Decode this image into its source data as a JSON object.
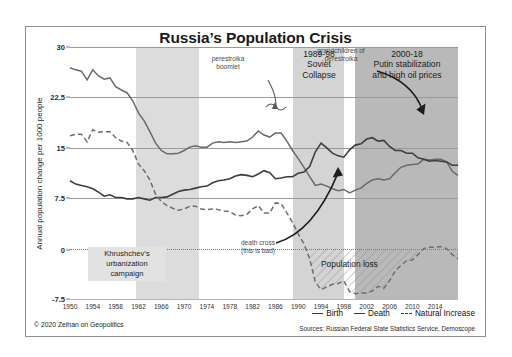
{
  "title": "Russia’s Population Crisis",
  "copyright": "© 2020 Zeihan on Geopolitics",
  "sources": "Sources: Russian Federal State Statistics Service, Demoscope",
  "legend": {
    "birth": "Birth",
    "death": "Death",
    "natural_increase": "Natural Increase"
  },
  "banners": [
    {
      "id": "soviet-collapse",
      "text": "1989-98\nSoviet\nCollapse",
      "lines": [
        "1989-98",
        "Soviet",
        "Collapse"
      ],
      "color": "#d4d4d4"
    },
    {
      "id": "putin",
      "text": "2000-18\nPutin stabilization\nand high oil prices",
      "lines": [
        "2000-18",
        "Putin stabilization",
        "and high oil prices"
      ],
      "color": "#b9b9b9"
    }
  ],
  "annotations": {
    "perestroika_boomlet": "perestroika\nboomlet",
    "perestroika_boomlet_lines": [
      "perestroika",
      "boomlet"
    ],
    "grandchildren": "grandchildren of\nperestroika",
    "grandchildren_lines": [
      "grandchildren of",
      "perestroika"
    ],
    "death_cross": "death cross\n(this is bad)",
    "death_cross_lines": [
      "death cross",
      "(this is bad)"
    ],
    "khrushchev": "Khrushchev’s\nurbanization\ncampaign",
    "khrushchev_lines": [
      "Khrushchev’s",
      "urbanization",
      "campaign"
    ],
    "population_loss": "Population loss"
  },
  "chart_data": {
    "type": "line",
    "title": "Russia’s Population Crisis",
    "xlabel": "",
    "ylabel": "Annual population change per 1000 people",
    "xlim": [
      1950,
      2018
    ],
    "ylim": [
      -7.5,
      30
    ],
    "yticks": [
      30,
      22.5,
      15,
      7.5,
      0,
      -7.5
    ],
    "ytick_labels": [
      "30",
      "22.5",
      "15",
      "7.5",
      "0",
      "-7.5"
    ],
    "xticks": [
      1950,
      1954,
      1958,
      1962,
      1966,
      1970,
      1974,
      1978,
      1982,
      1986,
      1990,
      1994,
      1998,
      2002,
      2006,
      2010,
      2014
    ],
    "grid": "horizontal",
    "legend_position": "bottom-right",
    "shaded_periods": [
      {
        "label": "Khrushchev’s urbanization campaign",
        "start": 1953,
        "end": 1964,
        "color": "#dcdcdc"
      },
      {
        "label": "1989-98 Soviet Collapse",
        "start": 1989,
        "end": 1998,
        "color": "#d4d4d4"
      },
      {
        "label": "2000-18 Putin stabilization and high oil prices",
        "start": 2000,
        "end": 2018,
        "color": "#b9b9b9"
      }
    ],
    "hatched_region": {
      "label": "Population loss",
      "start": 1992,
      "end": 2018,
      "note": "area between Natural Increase curve and zero line"
    },
    "x": [
      1950,
      1951,
      1952,
      1953,
      1954,
      1955,
      1956,
      1957,
      1958,
      1959,
      1960,
      1961,
      1962,
      1963,
      1964,
      1965,
      1966,
      1967,
      1968,
      1969,
      1970,
      1971,
      1972,
      1973,
      1974,
      1975,
      1976,
      1977,
      1978,
      1979,
      1980,
      1981,
      1982,
      1983,
      1984,
      1985,
      1986,
      1987,
      1988,
      1989,
      1990,
      1991,
      1992,
      1993,
      1994,
      1995,
      1996,
      1997,
      1998,
      1999,
      2000,
      2001,
      2002,
      2003,
      2004,
      2005,
      2006,
      2007,
      2008,
      2009,
      2010,
      2011,
      2012,
      2013,
      2014,
      2015,
      2016,
      2017,
      2018
    ],
    "series": [
      {
        "name": "Birth",
        "style": "solid",
        "color": "#575757",
        "values": [
          26.9,
          26.6,
          26.4,
          25.1,
          26.6,
          25.7,
          25.2,
          25.4,
          24.1,
          23.6,
          23.2,
          22.0,
          20.2,
          19.0,
          17.4,
          15.7,
          14.6,
          14.1,
          14.1,
          14.2,
          14.6,
          15.1,
          15.3,
          15.1,
          15.1,
          15.7,
          15.9,
          15.8,
          15.9,
          15.8,
          15.9,
          16.0,
          16.6,
          17.5,
          16.9,
          16.6,
          17.2,
          17.2,
          16.0,
          14.6,
          13.4,
          12.1,
          10.7,
          9.4,
          9.6,
          9.3,
          8.9,
          8.6,
          8.8,
          8.3,
          8.7,
          9.0,
          9.7,
          10.2,
          10.4,
          10.2,
          10.4,
          11.3,
          12.1,
          12.4,
          12.5,
          12.6,
          13.3,
          13.2,
          13.3,
          13.3,
          12.9,
          11.5,
          10.9
        ]
      },
      {
        "name": "Death",
        "style": "solid",
        "color": "#3f3f3f",
        "values": [
          10.1,
          9.6,
          9.4,
          9.2,
          8.9,
          8.4,
          7.8,
          8.0,
          7.6,
          7.6,
          7.4,
          7.4,
          7.6,
          7.4,
          7.2,
          7.6,
          7.6,
          7.7,
          8.1,
          8.5,
          8.7,
          8.8,
          9.0,
          9.2,
          9.3,
          9.8,
          10.1,
          10.2,
          10.4,
          10.8,
          11.0,
          10.9,
          10.7,
          11.1,
          11.6,
          11.3,
          10.4,
          10.5,
          10.7,
          10.7,
          11.2,
          11.4,
          12.2,
          14.4,
          15.7,
          15.0,
          14.2,
          13.8,
          13.6,
          14.7,
          15.4,
          15.6,
          16.3,
          16.5,
          16.0,
          16.1,
          15.2,
          14.6,
          14.6,
          14.2,
          14.2,
          13.5,
          13.3,
          13.0,
          13.1,
          13.0,
          12.9,
          12.4,
          12.4
        ]
      },
      {
        "name": "Natural Increase",
        "style": "dashed",
        "color": "#6b6b6b",
        "values": [
          16.8,
          17.0,
          17.0,
          15.9,
          17.7,
          17.3,
          17.4,
          17.4,
          16.5,
          16.0,
          15.8,
          14.6,
          12.6,
          11.6,
          10.2,
          8.1,
          7.0,
          6.4,
          6.0,
          5.7,
          5.9,
          6.3,
          6.3,
          5.9,
          5.8,
          5.9,
          5.8,
          5.6,
          5.5,
          5.0,
          4.9,
          5.1,
          5.9,
          6.4,
          5.3,
          5.3,
          6.8,
          6.7,
          5.3,
          3.9,
          2.2,
          0.7,
          -1.5,
          -5.0,
          -6.1,
          -5.7,
          -5.3,
          -5.2,
          -4.8,
          -6.4,
          -6.7,
          -6.6,
          -6.6,
          -6.3,
          -5.6,
          -5.9,
          -4.8,
          -3.3,
          -2.5,
          -1.8,
          -1.7,
          -0.9,
          0.0,
          0.2,
          0.2,
          0.3,
          0.0,
          -0.9,
          -1.5
        ]
      }
    ]
  }
}
